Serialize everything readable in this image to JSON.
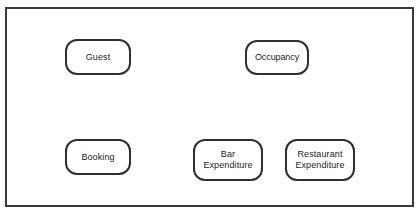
{
  "diagram": {
    "type": "entity-node-diagram",
    "frame": {
      "visible": true,
      "border_color": "#3a3a3c"
    },
    "background_color": "#ffffff",
    "node_border_color": "#2f2f31",
    "node_fill_color": "#ffffff",
    "text_color": "#1b1b1d",
    "connectors": [],
    "nodes": [
      {
        "id": "guest",
        "label": "Guest",
        "row": "top",
        "column": 1
      },
      {
        "id": "occupancy",
        "label": "Occupancy",
        "row": "top",
        "column": 2
      },
      {
        "id": "booking",
        "label": "Booking",
        "row": "bottom",
        "column": 1
      },
      {
        "id": "bar-expenditure",
        "label": "Bar\nExpenditure",
        "row": "bottom",
        "column": 2
      },
      {
        "id": "restaurant-expenditure",
        "label": "Restaurant\nExpenditure",
        "row": "bottom",
        "column": 3
      }
    ]
  }
}
